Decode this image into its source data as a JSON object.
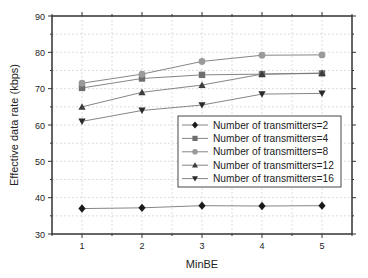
{
  "chart_data": {
    "type": "line",
    "title": "",
    "xlabel": "MinBE",
    "ylabel": "Effective data rate (kbps)",
    "x": [
      1,
      2,
      3,
      4,
      5
    ],
    "xlim": [
      0.5,
      5.5
    ],
    "ylim": [
      30,
      90
    ],
    "xticks": [
      1,
      2,
      3,
      4,
      5
    ],
    "yticks": [
      30,
      40,
      50,
      60,
      70,
      80,
      90
    ],
    "grid": true,
    "legend_position": "inside right, mid",
    "series": [
      {
        "name": "Number of transmitters=2",
        "marker": "diamond",
        "color": "#1a1a1a",
        "values": [
          37.0,
          37.2,
          37.8,
          37.7,
          37.8
        ]
      },
      {
        "name": "Number of transmitters=4",
        "marker": "square",
        "color": "#6e6e6e",
        "values": [
          70.2,
          72.8,
          73.8,
          74.0,
          74.2
        ]
      },
      {
        "name": "Number of transmitters=8",
        "marker": "circle",
        "color": "#9a9a9a",
        "values": [
          71.5,
          74.0,
          77.5,
          79.2,
          79.3
        ]
      },
      {
        "name": "Number of transmitters=12",
        "marker": "triangle-up",
        "color": "#3c3c3c",
        "values": [
          65.0,
          69.0,
          71.0,
          74.0,
          74.3
        ]
      },
      {
        "name": "Number of transmitters=16",
        "marker": "triangle-down",
        "color": "#2a2a2a",
        "values": [
          61.0,
          64.0,
          65.5,
          68.5,
          68.7
        ]
      }
    ]
  }
}
